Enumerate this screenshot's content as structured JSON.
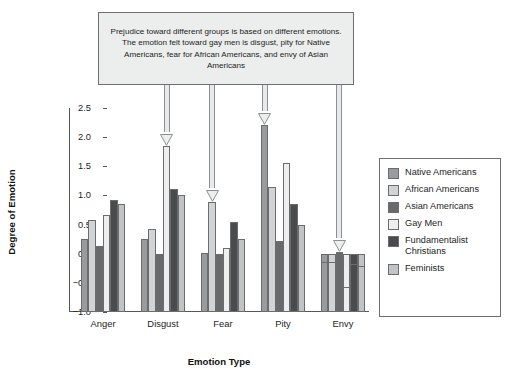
{
  "callout": {
    "text": "Prejudice toward different groups is based on different emotions. The emotion felt toward gay men is disgust, pity for Native Americans, fear for African Americans, and envy of Asian Americans"
  },
  "annotations": [
    {
      "name": "arrow-to-gay-men-disgust",
      "target_category": "Disgust",
      "target_series": "Gay Men"
    },
    {
      "name": "arrow-to-african-americans-fear",
      "target_category": "Fear",
      "target_series": "African Americans"
    },
    {
      "name": "arrow-to-native-americans-pity",
      "target_category": "Pity",
      "target_series": "Native Americans"
    },
    {
      "name": "arrow-to-asian-americans-envy",
      "target_category": "Envy",
      "target_series": "Asian Americans"
    }
  ],
  "legend": {
    "position": "right",
    "entries": [
      {
        "label": "Native Americans",
        "color": "#9a9b9c"
      },
      {
        "label": "African Americans",
        "color": "#d2d3d4"
      },
      {
        "label": "Asian Americans",
        "color": "#68696a"
      },
      {
        "label": "Gay Men",
        "color": "#eeeeef"
      },
      {
        "label": "Fundamentalist Christians",
        "color": "#4a4b4c"
      },
      {
        "label": "Feminists",
        "color": "#c2c3c4"
      }
    ]
  },
  "chart_data": {
    "type": "bar",
    "title": "",
    "xlabel": "Emotion Type",
    "ylabel": "Degree of Emotion",
    "ylim": [
      -1.0,
      2.5
    ],
    "yticks": [
      -1.0,
      -0.5,
      0.0,
      0.5,
      1.0,
      1.5,
      2.0,
      2.5
    ],
    "ytick_labels": [
      "−1.0",
      "−0.5",
      "0.0",
      "0.5",
      "1.0",
      "1.5",
      "2.0",
      "2.5"
    ],
    "grid": false,
    "categories": [
      "Anger",
      "Disgust",
      "Fear",
      "Pity",
      "Envy"
    ],
    "series": [
      {
        "name": "Native Americans",
        "color": "#9a9b9c",
        "values": [
          0.25,
          0.25,
          0.02,
          2.21,
          -0.15
        ]
      },
      {
        "name": "African Americans",
        "color": "#d2d3d4",
        "values": [
          0.58,
          0.43,
          0.89,
          1.15,
          -0.15
        ]
      },
      {
        "name": "Asian Americans",
        "color": "#68696a",
        "values": [
          0.13,
          0.0,
          -0.1,
          0.21,
          0.03
        ]
      },
      {
        "name": "Gay Men",
        "color": "#eeeeef",
        "values": [
          0.67,
          1.85,
          0.09,
          1.55,
          -0.57
        ]
      },
      {
        "name": "Fundamentalist Christians",
        "color": "#4a4b4c",
        "values": [
          0.93,
          1.11,
          0.54,
          0.86,
          -0.17
        ]
      },
      {
        "name": "Feminists",
        "color": "#c2c3c4",
        "values": [
          0.86,
          1.01,
          0.25,
          0.49,
          -0.21
        ]
      }
    ]
  }
}
